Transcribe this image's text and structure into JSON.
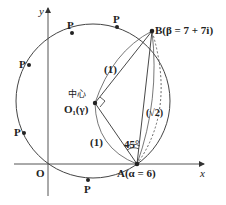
{
  "diagram": {
    "axes": {
      "x_label": "x",
      "y_label": "y",
      "origin_label": "O"
    },
    "points": {
      "A_label": "A(α = 6)",
      "B_label": "B(β = 7 + 7i)",
      "center_label": "O₁(γ)",
      "center_caption": "中心",
      "P_label": "P"
    },
    "annotations": {
      "segment_O1B": "(1)",
      "segment_O1A": "(1)",
      "segment_AB": "(√2)",
      "angle": "45°"
    },
    "colors": {
      "stroke": "#333333",
      "background": "#ffffff"
    }
  }
}
